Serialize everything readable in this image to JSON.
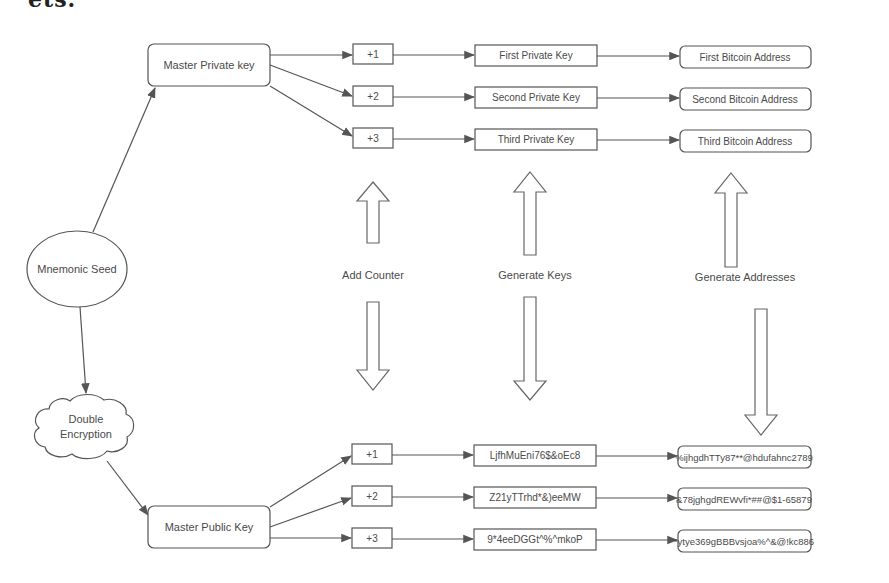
{
  "page": {
    "cut_title": "ets."
  },
  "diagram": {
    "root": {
      "label": "Mnemonic Seed",
      "shape": "ellipse"
    },
    "encryption": {
      "label_line1": "Double",
      "label_line2": "Encryption",
      "shape": "cloud"
    },
    "private_branch": {
      "master": "Master Private key",
      "counters": [
        "+1",
        "+2",
        "+3"
      ],
      "keys": [
        "First Private Key",
        "Second Private Key",
        "Third Private Key"
      ],
      "addresses": [
        "First Bitcoin Address",
        "Second Bitcoin Address",
        "Third Bitcoin Address"
      ]
    },
    "public_branch": {
      "master": "Master Public Key",
      "counters": [
        "+1",
        "+2",
        "+3"
      ],
      "keys": [
        "LjfhMuEni76$&oEc8",
        "Z21yTTrhd*&)eeMW",
        "9*4eeDGGt^%^mkoP"
      ],
      "addresses": [
        "%ijhgdhTTy87**@hdufahnc2789",
        "&78jghgdREWvfi*##@$1-65879",
        "*ytye369gBBBvsjoa%^&@!kc886"
      ]
    },
    "step_labels": {
      "add_counter": "Add Counter",
      "generate_keys": "Generate Keys",
      "generate_addresses": "Generate Addresses"
    },
    "colors": {
      "stroke": "#555555",
      "text": "#4a4a4a",
      "background": "#ffffff"
    }
  }
}
